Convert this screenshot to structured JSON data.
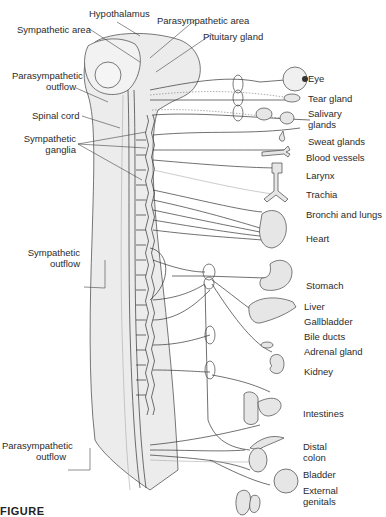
{
  "figure": {
    "caption": "FIGURE"
  },
  "left_labels": {
    "hypothalamus": "Hypothalamus",
    "sympathetic_area": "Sympathetic area",
    "parasympathetic_area": "Parasympathetic area",
    "pituitary_gland": "Pituitary gland",
    "parasympathetic_outflow_top_1": "Parasympathetic",
    "parasympathetic_outflow_top_2": "outflow",
    "spinal_cord": "Spinal cord",
    "sympathetic_ganglia_1": "Sympathetic",
    "sympathetic_ganglia_2": "ganglia",
    "sympathetic_outflow_1": "Sympathetic",
    "sympathetic_outflow_2": "outflow",
    "parasympathetic_outflow_bottom_1": "Parasympathetic",
    "parasympathetic_outflow_bottom_2": "outflow"
  },
  "organs": [
    {
      "id": "eye",
      "label": "Eye"
    },
    {
      "id": "tear-gland",
      "label": "Tear gland"
    },
    {
      "id": "salivary-glands",
      "label": "Salivary",
      "label2": "glands"
    },
    {
      "id": "sweat-glands",
      "label": "Sweat glands"
    },
    {
      "id": "blood-vessels",
      "label": "Blood vessels"
    },
    {
      "id": "larynx",
      "label": "Larynx"
    },
    {
      "id": "trachia",
      "label": "Trachia"
    },
    {
      "id": "bronchi-lungs",
      "label": "Bronchi and lungs"
    },
    {
      "id": "heart",
      "label": "Heart"
    },
    {
      "id": "stomach",
      "label": "Stomach"
    },
    {
      "id": "liver",
      "label": "Liver"
    },
    {
      "id": "gallbladder",
      "label": "Gallbladder"
    },
    {
      "id": "bile-ducts",
      "label": "Bile ducts"
    },
    {
      "id": "adrenal-gland",
      "label": "Adrenal gland"
    },
    {
      "id": "kidney",
      "label": "Kidney"
    },
    {
      "id": "intestines",
      "label": "Intestines"
    },
    {
      "id": "distal-colon",
      "label": "Distal",
      "label2": "colon"
    },
    {
      "id": "bladder",
      "label": "Bladder"
    },
    {
      "id": "external-genitals",
      "label": "External",
      "label2": "genitals"
    }
  ],
  "colors": {
    "body_fill": "#ececec",
    "line": "#333333",
    "text": "#2b2b2b"
  }
}
